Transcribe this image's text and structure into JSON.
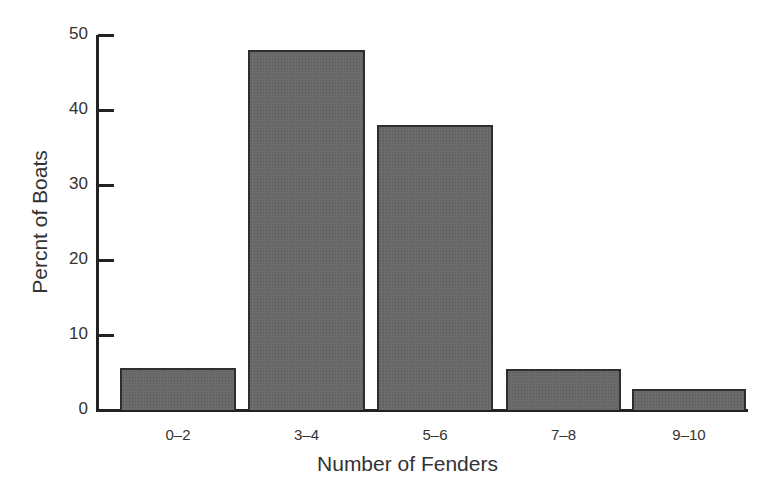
{
  "chart_data": {
    "type": "bar",
    "title": "",
    "xlabel": "Number of Fenders",
    "ylabel": "Percnt of Boats",
    "categories": [
      "0–2",
      "3–4",
      "5–6",
      "7–8",
      "9–10"
    ],
    "values": [
      5.6,
      48,
      38,
      5.5,
      2.8
    ],
    "ylim": [
      0,
      50
    ],
    "yticks": [
      0,
      10,
      20,
      30,
      40,
      50
    ],
    "grid": false,
    "legend": null,
    "bar_color": "#6b6b6b",
    "edge_color": "#2e2e2e"
  },
  "labels": {
    "xlabel": "Number of Fenders",
    "ylabel": "Percnt of Boats",
    "yticks": [
      "0",
      "10",
      "20",
      "30",
      "40",
      "50"
    ],
    "xticks": [
      "0–2",
      "3–4",
      "5–6",
      "7–8",
      "9–10"
    ]
  }
}
